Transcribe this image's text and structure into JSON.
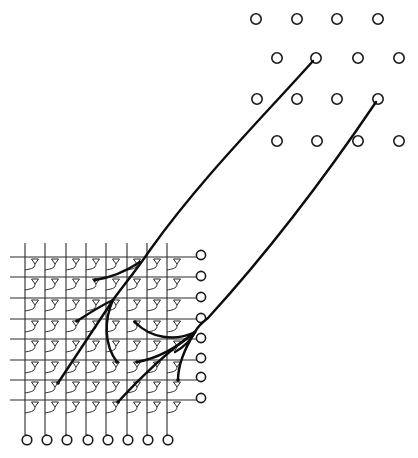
{
  "diagram": {
    "type": "crossbar-routing-schematic",
    "colors": {
      "stroke": "#1a1a1a",
      "background": "#ffffff",
      "route": "#0d0d0d"
    },
    "source_nodes": [
      {
        "x": 256,
        "y": 19
      },
      {
        "x": 297,
        "y": 19
      },
      {
        "x": 337,
        "y": 19
      },
      {
        "x": 378,
        "y": 19
      },
      {
        "x": 277,
        "y": 58
      },
      {
        "x": 316,
        "y": 58
      },
      {
        "x": 358,
        "y": 58
      },
      {
        "x": 399,
        "y": 58
      },
      {
        "x": 257,
        "y": 99
      },
      {
        "x": 297,
        "y": 99
      },
      {
        "x": 337,
        "y": 99
      },
      {
        "x": 378,
        "y": 99
      },
      {
        "x": 277,
        "y": 141
      },
      {
        "x": 317,
        "y": 141
      },
      {
        "x": 358,
        "y": 141
      },
      {
        "x": 399,
        "y": 141
      }
    ],
    "grid": {
      "columns_x": [
        25,
        45,
        66,
        86,
        106,
        127,
        147,
        167
      ],
      "rows_y": [
        257,
        277,
        298,
        319,
        339,
        360,
        380,
        400
      ],
      "line_left_x": 10,
      "line_right_x": 197,
      "line_top_y": 243,
      "line_bottom_y": 435,
      "cell_glyph": "triangle-down-with-curved-connector"
    },
    "row_terminals": [
      {
        "x": 201,
        "y": 255
      },
      {
        "x": 201,
        "y": 276
      },
      {
        "x": 201,
        "y": 297
      },
      {
        "x": 201,
        "y": 318
      },
      {
        "x": 201,
        "y": 338
      },
      {
        "x": 201,
        "y": 358
      },
      {
        "x": 201,
        "y": 377
      },
      {
        "x": 201,
        "y": 398
      }
    ],
    "column_terminals": [
      {
        "x": 27,
        "y": 440
      },
      {
        "x": 47,
        "y": 440
      },
      {
        "x": 67,
        "y": 440
      },
      {
        "x": 88,
        "y": 440
      },
      {
        "x": 108,
        "y": 440
      },
      {
        "x": 128,
        "y": 440
      },
      {
        "x": 148,
        "y": 440
      },
      {
        "x": 168,
        "y": 440
      }
    ],
    "routes": [
      {
        "name": "route-1",
        "path": "M 313 61 C 260 120, 200 180, 150 250 C 135 272, 120 290, 113 300 C 100 320, 80 350, 58 383",
        "branches": [
          "M 140 262 C 125 272, 108 278, 95 280",
          "M 113 300 C 100 306, 88 314, 77 321",
          "M 113 300 C 104 320, 104 345, 117 362"
        ],
        "endpoints": [
          {
            "x": 95,
            "y": 280
          },
          {
            "x": 77,
            "y": 321
          },
          {
            "x": 58,
            "y": 383
          },
          {
            "x": 117,
            "y": 362
          }
        ]
      },
      {
        "name": "route-2",
        "path": "M 376 102 C 330 170, 270 250, 208 318 C 200 324, 196 330, 195 332",
        "branches": [
          "M 195 332 C 175 342, 150 338, 135 322",
          "M 195 332 C 180 345, 160 358, 137 362",
          "M 195 332 C 170 350, 140 378, 118 402",
          "M 195 332 C 185 348, 178 365, 178 380",
          "M 195 332 C 190 342, 182 348, 175 352"
        ],
        "endpoints": [
          {
            "x": 135,
            "y": 322
          },
          {
            "x": 137,
            "y": 362
          },
          {
            "x": 118,
            "y": 402
          },
          {
            "x": 178,
            "y": 380
          }
        ]
      }
    ]
  }
}
